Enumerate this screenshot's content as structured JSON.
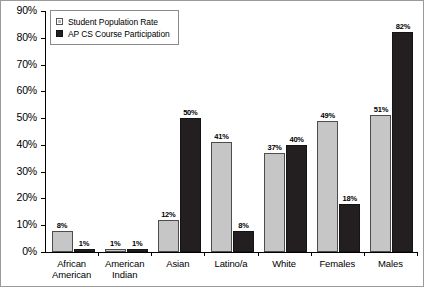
{
  "chart_data": {
    "type": "bar",
    "title": "",
    "xlabel": "",
    "ylabel": "",
    "ylim": [
      0,
      90
    ],
    "grid": false,
    "legend_position": "top-left",
    "ytick_labels": [
      "90%",
      "80%",
      "70%",
      "60%",
      "50%",
      "40%",
      "30%",
      "20%",
      "10%",
      "0%"
    ],
    "ytick_values": [
      90,
      80,
      70,
      60,
      50,
      40,
      30,
      20,
      10,
      0
    ],
    "categories": [
      "African American",
      "American Indian",
      "Asian",
      "Latino/a",
      "White",
      "Females",
      "Males"
    ],
    "category_lines": [
      [
        "African",
        "American"
      ],
      [
        "American",
        "Indian"
      ],
      [
        "Asian"
      ],
      [
        "Latino/a"
      ],
      [
        "White"
      ],
      [
        "Females"
      ],
      [
        "Males"
      ]
    ],
    "series": [
      {
        "name": "Student Population Rate",
        "color": "#c6c6c6",
        "values": [
          8,
          1,
          12,
          41,
          37,
          49,
          51
        ],
        "labels": [
          "8%",
          "1%",
          "12%",
          "41%",
          "37%",
          "49%",
          "51%"
        ]
      },
      {
        "name": "AP CS Course Participation",
        "color": "#231f20",
        "values": [
          1,
          1,
          50,
          8,
          40,
          18,
          82
        ],
        "labels": [
          "1%",
          "1%",
          "50%",
          "8%",
          "40%",
          "18%",
          "82%"
        ]
      }
    ]
  },
  "legend": {
    "items": [
      {
        "label": "Student Population Rate",
        "swatch": "light-gray-square"
      },
      {
        "label": "AP CS Course Participation",
        "swatch": "black-square"
      }
    ]
  }
}
